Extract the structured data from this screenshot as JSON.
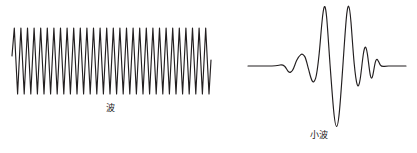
{
  "figure": {
    "background_color": "#ffffff",
    "stroke_color": "#231f20",
    "width": 417,
    "height": 153
  },
  "panels": {
    "wave": {
      "caption": "波",
      "caption_meaning": "wave"
    },
    "wavelet": {
      "caption": "小波",
      "caption_meaning": "wavelet"
    }
  },
  "chart_data": [
    {
      "type": "line",
      "name": "wave",
      "title": "波",
      "xlabel": "",
      "ylabel": "",
      "grid": false,
      "legend": "none",
      "axis_visible": false,
      "xlim": [
        0,
        15.2
      ],
      "ylim": [
        -1.15,
        1.15
      ],
      "description": "Continuous sinusoid of constant amplitude, approximately 15 full cycles, drawn with sharp peaks and troughs, starting mid-descent and ending mid-rise.",
      "cycles": 15,
      "amplitude": 1.0,
      "baseline": 0,
      "formula": "y = sin(2*pi*x)",
      "x": [
        0,
        0.25,
        0.5,
        0.75,
        1,
        1.25,
        1.5,
        1.75,
        2,
        2.25,
        2.5,
        2.75,
        3,
        3.25,
        3.5,
        3.75,
        4,
        4.25,
        4.5,
        4.75,
        5,
        5.25,
        5.5,
        5.75,
        6,
        6.25,
        6.5,
        6.75,
        7,
        7.25,
        7.5,
        7.75,
        8,
        8.25,
        8.5,
        8.75,
        9,
        9.25,
        9.5,
        9.75,
        10,
        10.25,
        10.5,
        10.75,
        11,
        11.25,
        11.5,
        11.75,
        12,
        12.25,
        12.5,
        12.75,
        13,
        13.25,
        13.5,
        13.75,
        14,
        14.25,
        14.5,
        14.75,
        15
      ],
      "values": [
        0.45,
        1,
        0,
        -1,
        0,
        1,
        0,
        -1,
        0,
        1,
        0,
        -1,
        0,
        1,
        0,
        -1,
        0,
        1,
        0,
        -1,
        0,
        1,
        0,
        -1,
        0,
        1,
        0,
        -1,
        0,
        1,
        0,
        -1,
        0,
        1,
        0,
        -1,
        0,
        1,
        0,
        -1,
        0,
        1,
        0,
        -1,
        0,
        1,
        0,
        -1,
        0,
        1,
        0,
        -1,
        0,
        1,
        0,
        -1,
        0,
        1,
        0,
        -1,
        0.35
      ]
    },
    {
      "type": "line",
      "name": "wavelet",
      "title": "小波",
      "xlabel": "",
      "ylabel": "",
      "grid": false,
      "legend": "none",
      "axis_visible": false,
      "xlim": [
        -6,
        6
      ],
      "ylim": [
        -2.05,
        1.75
      ],
      "description": "Localized damped oscillation (wavelet): flat zero baseline at both ends, small ripples growing toward the centre, two tall positive peaks flanking one very deep negative trough, then rapid decay back to zero.",
      "baseline": 0,
      "x": [
        -6,
        -5,
        -4,
        -3.4,
        -3.0,
        -2.7,
        -2.45,
        -2.2,
        -1.95,
        -1.7,
        -1.45,
        -1.2,
        -0.95,
        -0.75,
        -0.55,
        -0.4,
        -0.28,
        -0.16,
        -0.05,
        0.05,
        0.18,
        0.3,
        0.42,
        0.55,
        0.7,
        0.85,
        1.0,
        1.15,
        1.3,
        1.45,
        1.62,
        1.8,
        2.0,
        2.25,
        2.5,
        2.85,
        3.3,
        4,
        5,
        6
      ],
      "values": [
        0,
        0,
        0,
        0.02,
        0.06,
        0.0,
        -0.18,
        -0.3,
        -0.12,
        0.22,
        0.55,
        0.62,
        0.38,
        -0.1,
        -0.72,
        -1.05,
        -0.6,
        0.55,
        1.62,
        1.68,
        0.4,
        -1.1,
        -1.95,
        -1.4,
        -0.2,
        0.9,
        1.66,
        1.1,
        0.1,
        -0.62,
        -0.9,
        -0.42,
        0.2,
        0.42,
        0.22,
        -0.12,
        -0.05,
        0.0,
        0,
        0
      ]
    }
  ]
}
